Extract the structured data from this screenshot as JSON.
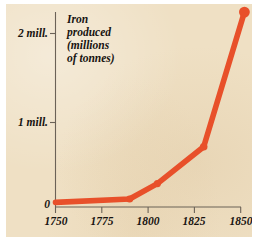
{
  "figure": {
    "background_color": "#ffffff",
    "plate_color": "#efe0c4",
    "title_lines": [
      "Iron",
      "produced",
      "(millions",
      "of tonnes)"
    ]
  },
  "chart_data": {
    "type": "line",
    "title": "Iron produced (millions of tonnes)",
    "xlabel": "",
    "ylabel": "Iron produced (millions of tonnes)",
    "xlim": [
      1750,
      1855
    ],
    "ylim": [
      0,
      2.3
    ],
    "grid": false,
    "legend": null,
    "series_color": "#e8502a",
    "x": [
      1750,
      1790,
      1805,
      1830,
      1852
    ],
    "values": [
      0.03,
      0.07,
      0.25,
      0.68,
      2.25
    ],
    "points": [
      {
        "x": 1750,
        "y": 0.03,
        "marker": false
      },
      {
        "x": 1790,
        "y": 0.07,
        "marker": true
      },
      {
        "x": 1805,
        "y": 0.25,
        "marker": true
      },
      {
        "x": 1830,
        "y": 0.68,
        "marker": true
      },
      {
        "x": 1852,
        "y": 2.25,
        "marker": true
      }
    ],
    "x_ticks": [
      1750,
      1775,
      1800,
      1825,
      1850
    ],
    "x_tick_labels": [
      "1750",
      "1775",
      "1800",
      "1825",
      "1850"
    ],
    "y_ticks": [
      0,
      1,
      2
    ],
    "y_tick_labels": [
      "0",
      "1 mill.",
      "2 mill."
    ]
  },
  "axes": {
    "y_labels": [
      {
        "text": "2 mill.",
        "value": 2
      },
      {
        "text": "1 mill.",
        "value": 1
      },
      {
        "text": "0",
        "value": 0
      }
    ],
    "x_labels": [
      {
        "text": "1750",
        "value": 1750
      },
      {
        "text": "1775",
        "value": 1775
      },
      {
        "text": "1800",
        "value": 1800
      },
      {
        "text": "1825",
        "value": 1825
      },
      {
        "text": "1850",
        "value": 1850
      }
    ],
    "axis_color": "#6b6257"
  }
}
